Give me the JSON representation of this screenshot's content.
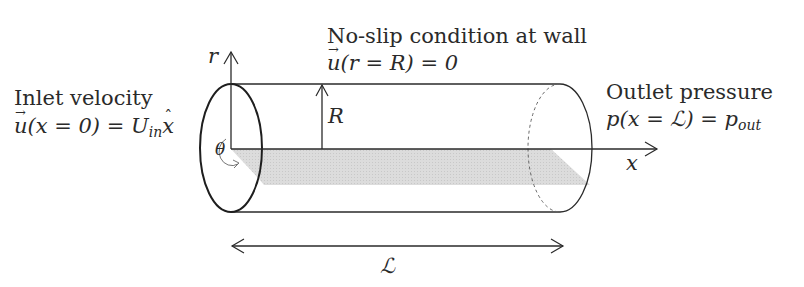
{
  "diagram": {
    "inlet": {
      "heading": "Inlet velocity",
      "equation": {
        "lhs_vec": "u",
        "arg": "(x = 0) = ",
        "rhs": "U",
        "rhs_sub": "in",
        "unit_vec": "x"
      }
    },
    "wall": {
      "heading": "No-slip condition at wall",
      "equation": {
        "lhs_vec": "u",
        "arg": "(r = R) = 0"
      }
    },
    "outlet": {
      "heading": "Outlet pressure",
      "equation": {
        "lhs": "p",
        "arg": "(x = ℒ) = ",
        "rhs": "p",
        "rhs_sub": "out"
      }
    },
    "axes": {
      "r_label": "r",
      "x_label": "x",
      "theta_label": "θ"
    },
    "radius_label": "R",
    "length_label": "ℒ",
    "colors": {
      "stroke": "#2a2a2a",
      "shade": "#d9d9d9",
      "dashed": "#666666"
    }
  }
}
